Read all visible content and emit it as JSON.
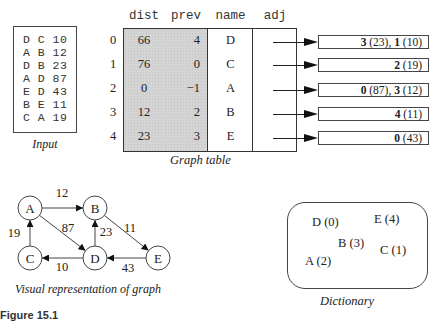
{
  "input": {
    "lines": [
      "D C 10",
      "A B 12",
      "D B 23",
      "A D 87",
      "E D 43",
      "B E 11",
      "C A 19"
    ],
    "caption": "Input"
  },
  "graph_table": {
    "headers": {
      "dist": "dist",
      "prev": "prev",
      "name": "name",
      "adj": "adj"
    },
    "rows": [
      {
        "index": "0",
        "dist": "66",
        "prev": "4",
        "name": "D"
      },
      {
        "index": "1",
        "dist": "76",
        "prev": "0",
        "name": "C"
      },
      {
        "index": "2",
        "dist": "0",
        "prev": "−1",
        "name": "A"
      },
      {
        "index": "3",
        "dist": "12",
        "prev": "2",
        "name": "B"
      },
      {
        "index": "4",
        "dist": "23",
        "prev": "3",
        "name": "E"
      }
    ],
    "caption": "Graph table"
  },
  "adjacency": [
    [
      {
        "v": "3",
        "w": " (23), "
      },
      {
        "v": "1",
        "w": " (10)"
      }
    ],
    [
      {
        "v": "2",
        "w": " (19)"
      }
    ],
    [
      {
        "v": "0",
        "w": " (87), "
      },
      {
        "v": "3",
        "w": " (12)"
      }
    ],
    [
      {
        "v": "4",
        "w": " (11)"
      }
    ],
    [
      {
        "v": "0",
        "w": " (43)"
      }
    ]
  ],
  "graph": {
    "nodes": [
      "A",
      "B",
      "C",
      "D",
      "E"
    ],
    "edges": [
      {
        "from": "A",
        "to": "B",
        "weight": "12"
      },
      {
        "from": "A",
        "to": "D",
        "weight": "87"
      },
      {
        "from": "B",
        "to": "E",
        "weight": "11"
      },
      {
        "from": "D",
        "to": "B",
        "weight": "23"
      },
      {
        "from": "D",
        "to": "C",
        "weight": "10"
      },
      {
        "from": "E",
        "to": "D",
        "weight": "43"
      },
      {
        "from": "C",
        "to": "A",
        "weight": "19"
      }
    ],
    "caption": "Visual representation of graph"
  },
  "dictionary": {
    "items": [
      "D (0)",
      "E (4)",
      "B (3)",
      "C (1)",
      "A (2)"
    ],
    "caption": "Dictionary"
  },
  "figure_caption": "Figure 15.1"
}
